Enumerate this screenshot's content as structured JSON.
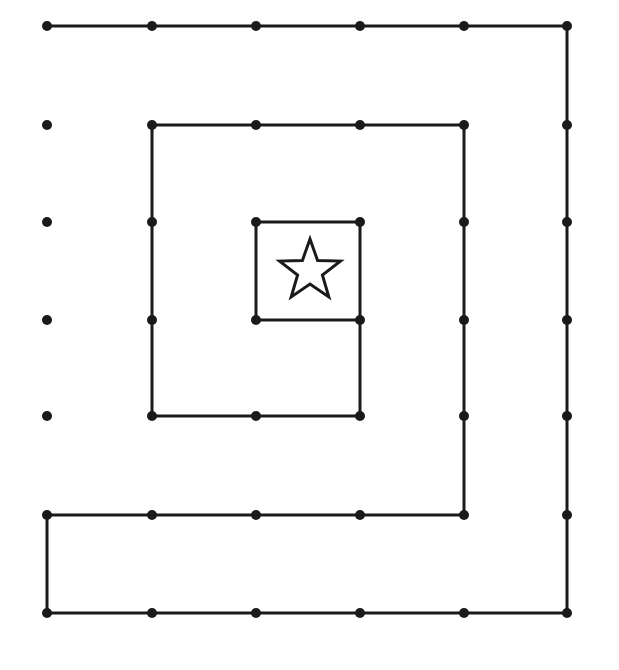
{
  "diagram": {
    "type": "dot-grid-spiral",
    "background": "#ffffff",
    "ink": "#1a1a1a",
    "grid": {
      "columns_x": [
        47,
        152,
        256,
        360,
        464,
        567
      ],
      "rows_y": [
        26,
        125,
        222,
        320,
        416,
        515,
        613
      ],
      "dot_radius": 5
    },
    "path": [
      [
        0,
        0
      ],
      [
        1,
        0
      ],
      [
        2,
        0
      ],
      [
        3,
        0
      ],
      [
        4,
        0
      ],
      [
        5,
        0
      ],
      [
        5,
        1
      ],
      [
        5,
        2
      ],
      [
        5,
        3
      ],
      [
        5,
        4
      ],
      [
        5,
        5
      ],
      [
        5,
        6
      ],
      [
        4,
        6
      ],
      [
        3,
        6
      ],
      [
        2,
        6
      ],
      [
        1,
        6
      ],
      [
        0,
        6
      ],
      [
        0,
        5
      ],
      [
        1,
        5
      ],
      [
        2,
        5
      ],
      [
        3,
        5
      ],
      [
        4,
        5
      ],
      [
        4,
        4
      ],
      [
        4,
        3
      ],
      [
        4,
        2
      ],
      [
        4,
        1
      ],
      [
        3,
        1
      ],
      [
        2,
        1
      ],
      [
        1,
        1
      ],
      [
        1,
        2
      ],
      [
        1,
        3
      ],
      [
        1,
        4
      ],
      [
        2,
        4
      ],
      [
        3,
        4
      ],
      [
        3,
        3
      ],
      [
        3,
        2
      ],
      [
        2,
        2
      ],
      [
        2,
        3
      ],
      [
        3,
        3
      ]
    ],
    "isolated_dots": [
      [
        0,
        1
      ],
      [
        0,
        2
      ],
      [
        0,
        3
      ],
      [
        0,
        4
      ]
    ],
    "center_symbol": {
      "name": "star-icon",
      "shape": "five-point-star-outline",
      "cx": 310,
      "cy": 271,
      "outer_r": 32,
      "inner_r": 13
    }
  }
}
